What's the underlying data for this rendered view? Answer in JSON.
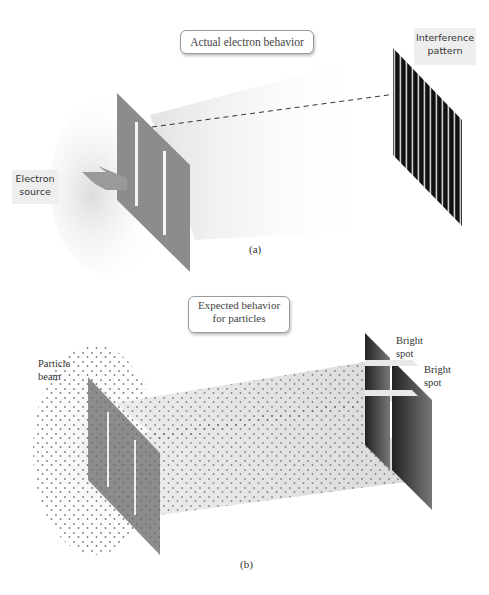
{
  "panel_a": {
    "title": "Actual electron behavior",
    "source_label_line1": "Electron",
    "source_label_line2": "source",
    "screen_label_line1": "Interference",
    "screen_label_line2": "pattern",
    "caption": "(a)"
  },
  "panel_b": {
    "title_line1": "Expected behavior",
    "title_line2": "for particles",
    "beam_label_line1": "Particle",
    "beam_label_line2": "beam",
    "spot1_line1": "Bright",
    "spot1_line2": "spot",
    "spot2_line1": "Bright",
    "spot2_line2": "spot",
    "caption": "(b)"
  },
  "colors": {
    "barrier": "#8a8a8a",
    "screen_dark": "#1a1a1a",
    "beam_shade": "#e6e6e6",
    "dots": "#555555"
  }
}
